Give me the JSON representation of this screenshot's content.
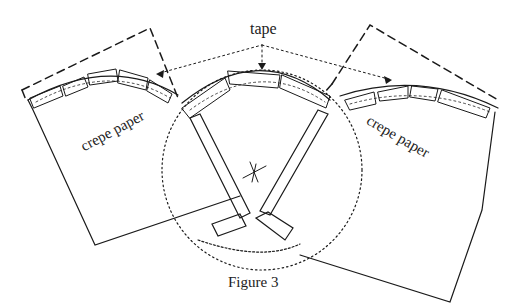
{
  "figure": {
    "caption": "Figure 3",
    "labels": {
      "tape": "tape",
      "left_panel": "crepe paper",
      "right_panel": "crepe paper"
    },
    "ink_color": "#1a1a1a"
  }
}
